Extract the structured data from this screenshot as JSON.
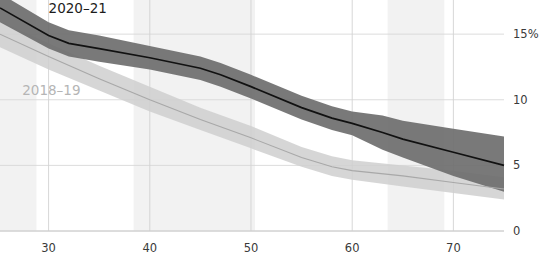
{
  "chart_data": {
    "type": "line",
    "title": "",
    "subtitle": "",
    "xlabel": "",
    "ylabel": "",
    "xlim": [
      25.2,
      75.0
    ],
    "ylim": [
      0,
      17.6
    ],
    "x_ticks": [
      30,
      40,
      50,
      60,
      70
    ],
    "x_tick_labels": [
      "30",
      "40",
      "50",
      "60",
      "70"
    ],
    "y_ticks": [
      0,
      5,
      10,
      15
    ],
    "y_tick_labels": [
      "0",
      "5",
      "10",
      "15%"
    ],
    "y_axis_position": "right",
    "grid": true,
    "legend": "inline-labels",
    "shaded_x_bands": [
      {
        "from": 25.2,
        "to": 28.8
      },
      {
        "from": 38.4,
        "to": 50.4
      },
      {
        "from": 63.5,
        "to": 69.1
      }
    ],
    "series": [
      {
        "name": "2020-21",
        "color": "#6e6e6e",
        "line_color": "#111111",
        "label_color": "#1c1c1c",
        "label_x": 30.0,
        "label_y": 16.6,
        "x": [
          25.2,
          30,
          32,
          35,
          40,
          45,
          47,
          50,
          55,
          58,
          60,
          63,
          65,
          70,
          75
        ],
        "values": [
          17.0,
          14.9,
          14.3,
          13.9,
          13.2,
          12.4,
          11.9,
          11.0,
          9.4,
          8.6,
          8.2,
          7.5,
          7.0,
          6.0,
          5.0
        ],
        "band_low": [
          15.9,
          13.9,
          13.3,
          12.9,
          12.3,
          11.5,
          11.0,
          10.1,
          8.5,
          7.7,
          7.3,
          6.2,
          5.6,
          4.2,
          3.0
        ],
        "band_high": [
          18.1,
          15.9,
          15.3,
          14.9,
          14.1,
          13.3,
          12.8,
          11.9,
          10.3,
          9.5,
          9.1,
          8.8,
          8.4,
          7.8,
          7.2
        ]
      },
      {
        "name": "2018-19",
        "color": "#cfcfcf",
        "line_color": "#a8a8a8",
        "label_color": "#b5b5b5",
        "label_x": 27.4,
        "label_y": 10.4,
        "x": [
          25.2,
          30,
          35,
          40,
          45,
          50,
          55,
          58,
          60,
          65,
          70,
          75
        ],
        "values": [
          15.0,
          13.3,
          11.6,
          10.0,
          8.5,
          7.1,
          5.6,
          4.9,
          4.6,
          4.2,
          3.7,
          3.2
        ],
        "band_low": [
          14.0,
          12.3,
          10.7,
          9.1,
          7.7,
          6.3,
          4.9,
          4.2,
          3.9,
          3.4,
          2.9,
          2.4
        ],
        "band_high": [
          16.0,
          14.3,
          12.6,
          11.0,
          9.4,
          8.0,
          6.4,
          5.7,
          5.4,
          5.0,
          4.6,
          4.1
        ]
      }
    ]
  },
  "axis": {
    "x_labels": [
      "30",
      "40",
      "50",
      "60",
      "70"
    ],
    "y_labels": [
      "15%",
      "10",
      "5",
      "0"
    ]
  },
  "labels": {
    "dark_series": "2020–21",
    "light_series": "2018–19"
  }
}
